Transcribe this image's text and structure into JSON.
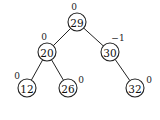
{
  "diagram": {
    "type": "avl-tree",
    "nodes": [
      {
        "id": "n29",
        "value": "29",
        "balance": "0",
        "cx": 77,
        "cy": 22,
        "bx": 74,
        "by": 7
      },
      {
        "id": "n20",
        "value": "20",
        "balance": "0",
        "cx": 47,
        "cy": 52,
        "bx": 44,
        "by": 37
      },
      {
        "id": "n30",
        "value": "30",
        "balance": "−1",
        "cx": 110,
        "cy": 52,
        "bx": 118,
        "by": 38
      },
      {
        "id": "n12",
        "value": "12",
        "balance": "0",
        "cx": 27,
        "cy": 88,
        "bx": 17,
        "by": 76
      },
      {
        "id": "n26",
        "value": "26",
        "balance": "0",
        "cx": 68,
        "cy": 88,
        "bx": 81,
        "by": 80
      },
      {
        "id": "n32",
        "value": "32",
        "balance": "0",
        "cx": 135,
        "cy": 88,
        "bx": 149,
        "by": 80
      }
    ],
    "edges": [
      {
        "from": "n29",
        "to": "n20"
      },
      {
        "from": "n29",
        "to": "n30"
      },
      {
        "from": "n20",
        "to": "n12"
      },
      {
        "from": "n20",
        "to": "n26"
      },
      {
        "from": "n30",
        "to": "n32"
      }
    ],
    "node_radius": 9
  }
}
